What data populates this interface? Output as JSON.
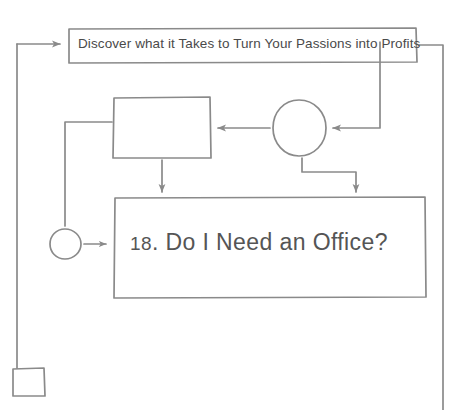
{
  "diagram": {
    "type": "flowchart",
    "stroke_color": "#8a8a8a",
    "text_color": "#4a4a4a",
    "background": "#ffffff",
    "nodes": {
      "header_box": {
        "shape": "rectangle",
        "label": "Discover what it Takes to Turn Your Passions into Profits"
      },
      "blank_box": {
        "shape": "rectangle",
        "label": ""
      },
      "circle_node": {
        "shape": "circle",
        "label": ""
      },
      "main_box": {
        "shape": "rectangle",
        "label_number": "18",
        "label_rest": ". Do I Need an Office?",
        "label": "18. Do I Need an Office?"
      },
      "small_circle": {
        "shape": "circle",
        "label": ""
      },
      "small_square": {
        "shape": "square",
        "label": ""
      }
    },
    "connectors": [
      {
        "name": "left-rail-to-header",
        "from": "left-rail",
        "to": "header_box",
        "arrow": true
      },
      {
        "name": "header-to-right-rail",
        "from": "header_box",
        "to": "right-rail",
        "arrow": false
      },
      {
        "name": "right-down-to-circle",
        "from": "header_box",
        "to": "circle_node",
        "arrow": true
      },
      {
        "name": "circle-to-blank-box",
        "from": "circle_node",
        "to": "blank_box",
        "arrow": true
      },
      {
        "name": "blank-box-to-main-box",
        "from": "blank_box",
        "to": "main_box",
        "arrow": true
      },
      {
        "name": "circle-to-main-box",
        "from": "circle_node",
        "to": "main_box",
        "arrow": true
      },
      {
        "name": "small-circle-to-main-box",
        "from": "small_circle",
        "to": "main_box",
        "arrow": true
      },
      {
        "name": "blank-box-left-feed",
        "from": "left-branch",
        "to": "blank_box",
        "arrow": false
      },
      {
        "name": "left-rail-to-small-square",
        "from": "left-rail",
        "to": "small_square",
        "arrow": false
      }
    ]
  }
}
